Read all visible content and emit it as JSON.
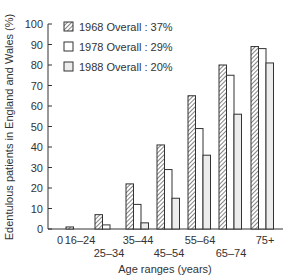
{
  "chart_data": {
    "type": "bar",
    "title": "",
    "xlabel": "Age ranges (years)",
    "ylabel": "Edentulous patients in England and Wales (%)",
    "ylim": [
      0,
      100
    ],
    "yticks": [
      0,
      10,
      20,
      30,
      40,
      50,
      60,
      70,
      80,
      90,
      100
    ],
    "grid": false,
    "legend_position": "top-left inside",
    "categories": [
      "16–24",
      "25–34",
      "35–44",
      "45–54",
      "55–64",
      "65–74",
      "75+"
    ],
    "zero_label": "0",
    "series": [
      {
        "name": "1968 Overall : 37%",
        "pattern": "hatched",
        "values": [
          1,
          7,
          22,
          41,
          65,
          80,
          89
        ]
      },
      {
        "name": "1978 Overall : 29%",
        "pattern": "white",
        "values": [
          0,
          2,
          12,
          29,
          49,
          75,
          88
        ]
      },
      {
        "name": "1988 Overall : 20%",
        "pattern": "light-grey",
        "values": [
          0,
          0,
          3,
          15,
          36,
          56,
          81
        ]
      }
    ]
  },
  "colors": {
    "axis": "#333333",
    "bar_outline": "#333333",
    "fill_1968_bg": "#ffffff",
    "fill_1978": "#ffffff",
    "fill_1988": "#ececec"
  }
}
